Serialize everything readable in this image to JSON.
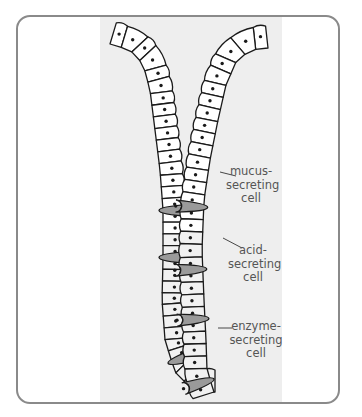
{
  "diagram": {
    "colors": {
      "frame_border": "#8a8a8a",
      "tissue_background": "#eeeeee",
      "cell_fill": "#ffffff",
      "cell_fill_lower": "#f1f1f1",
      "acid_cell_fill": "#9a9a9a",
      "outline": "#1a1a1a",
      "label_color": "#555555"
    },
    "labels": [
      {
        "id": "mucus",
        "line1": "mucus-",
        "line2": "secreting",
        "line3": "cell",
        "x": 238,
        "y": 171
      },
      {
        "id": "acid",
        "line1": "acid-",
        "line2": "secreting",
        "line3": "cell",
        "x": 238,
        "y": 243
      },
      {
        "id": "enzyme",
        "line1": "enzyme-",
        "line2": "secreting",
        "line3": "cell",
        "x": 234,
        "y": 323
      }
    ],
    "leader_lines": [
      {
        "id": "mucus",
        "x1": 220,
        "y1": 172,
        "x2": 236,
        "y2": 176
      },
      {
        "id": "acid",
        "x1": 223,
        "y1": 238,
        "x2": 242,
        "y2": 248
      },
      {
        "id": "enzyme",
        "x1": 218,
        "y1": 328,
        "x2": 232,
        "y2": 328
      }
    ]
  }
}
